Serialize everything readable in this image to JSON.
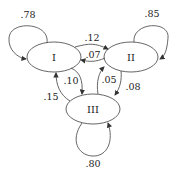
{
  "diagram": {
    "type": "markov-chain",
    "nodes": [
      {
        "id": "I",
        "label": "I"
      },
      {
        "id": "II",
        "label": "II"
      },
      {
        "id": "III",
        "label": "III"
      }
    ],
    "edges": [
      {
        "from": "I",
        "to": "I",
        "label": ".78"
      },
      {
        "from": "II",
        "to": "II",
        "label": ".85"
      },
      {
        "from": "III",
        "to": "III",
        "label": ".80"
      },
      {
        "from": "I",
        "to": "II",
        "label": ".12"
      },
      {
        "from": "II",
        "to": "I",
        "label": ".07"
      },
      {
        "from": "I",
        "to": "III",
        "label": ".10"
      },
      {
        "from": "III",
        "to": "I",
        "label": ".15"
      },
      {
        "from": "III",
        "to": "II",
        "label": ".05"
      },
      {
        "from": "II",
        "to": "III",
        "label": ".08"
      }
    ]
  }
}
